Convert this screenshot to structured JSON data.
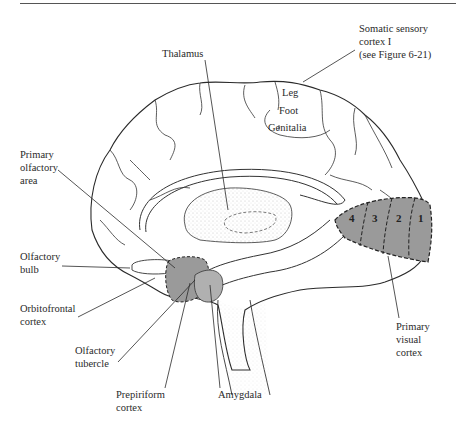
{
  "figure": {
    "type": "medial view of brain",
    "labels": {
      "somatic_sensory": [
        "Somatic sensory",
        "cortex I",
        "(see Figure 6-21)"
      ],
      "thalamus": [
        "Thalamus"
      ],
      "leg": "Leg",
      "foot": "Foot",
      "genitalia": "Genitalia",
      "primary_olfactory": [
        "Primary",
        "olfactory",
        "area"
      ],
      "olfactory_bulb": [
        "Olfactory",
        "bulb"
      ],
      "orbitofrontal": [
        "Orbitofrontal",
        "cortex"
      ],
      "olfactory_tubercle": [
        "Olfactory",
        "tubercle"
      ],
      "prepiriform": [
        "Prepiriform",
        "cortex"
      ],
      "amygdala": [
        "Amygdala"
      ],
      "primary_visual": [
        "Primary",
        "visual",
        "cortex"
      ]
    },
    "visual_areas": [
      "4",
      "3",
      "2",
      "1"
    ],
    "colors": {
      "line": "#2a2a2a",
      "shaded_region": "#9a9a9a",
      "amygdala_fill": "#b0b0b0",
      "stipple": "#cfcfcf",
      "background": "#ffffff"
    }
  }
}
